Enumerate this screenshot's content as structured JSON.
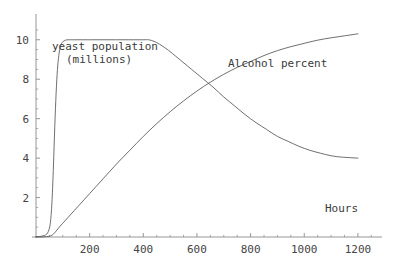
{
  "chart_data": {
    "type": "line",
    "title": "",
    "xlabel": "Hours",
    "ylabel": "",
    "xlim": [
      0,
      1260
    ],
    "ylim": [
      0,
      10.8
    ],
    "grid": false,
    "legend_position": "inline-annotations",
    "x_ticks": [
      200,
      400,
      600,
      800,
      1000,
      1200
    ],
    "y_ticks": [
      2,
      4,
      6,
      8,
      10
    ],
    "x_tick_labels": [
      "200",
      "400",
      "600",
      "800",
      "1000",
      "1200"
    ],
    "y_tick_labels": [
      "2",
      "4",
      "6",
      "8",
      "10"
    ],
    "annotations": [
      {
        "name": "yeast-population-label",
        "line1": "yeast population",
        "line2": "(millions)"
      },
      {
        "name": "alcohol-percent-label",
        "text": "Alcohol percent"
      },
      {
        "name": "hours-axis-label",
        "text": "Hours"
      }
    ],
    "series": [
      {
        "name": "yeast population (millions)",
        "color": "#555555",
        "x": [
          0,
          20,
          40,
          50,
          55,
          60,
          65,
          70,
          75,
          80,
          85,
          90,
          95,
          100,
          110,
          120,
          130,
          150,
          200,
          250,
          300,
          350,
          400,
          420,
          440,
          460,
          480,
          500,
          540,
          580,
          620,
          660,
          700,
          740,
          780,
          820,
          860,
          900,
          940,
          980,
          1020,
          1060,
          1100,
          1140,
          1200
        ],
        "y": [
          0.02,
          0.04,
          0.15,
          0.45,
          0.9,
          1.9,
          3.6,
          5.6,
          7.3,
          8.5,
          9.2,
          9.6,
          9.8,
          9.9,
          9.98,
          10.0,
          10.0,
          10.0,
          10.0,
          10.0,
          10.0,
          10.0,
          10.0,
          10.0,
          9.92,
          9.78,
          9.6,
          9.4,
          8.95,
          8.5,
          8.05,
          7.6,
          7.1,
          6.65,
          6.2,
          5.8,
          5.45,
          5.1,
          4.85,
          4.6,
          4.4,
          4.25,
          4.12,
          4.05,
          4.0
        ]
      },
      {
        "name": "Alcohol percent",
        "color": "#555555",
        "x": [
          0,
          20,
          40,
          55,
          65,
          75,
          90,
          110,
          130,
          160,
          200,
          250,
          300,
          350,
          400,
          450,
          500,
          550,
          600,
          650,
          700,
          750,
          800,
          850,
          900,
          950,
          1000,
          1050,
          1100,
          1150,
          1200
        ],
        "y": [
          0.0,
          0.0,
          0.02,
          0.06,
          0.15,
          0.3,
          0.55,
          0.85,
          1.15,
          1.6,
          2.2,
          2.95,
          3.7,
          4.4,
          5.1,
          5.75,
          6.35,
          6.9,
          7.4,
          7.85,
          8.25,
          8.6,
          8.9,
          9.2,
          9.45,
          9.65,
          9.82,
          9.98,
          10.1,
          10.2,
          10.3
        ]
      }
    ]
  },
  "axes": {
    "axis_color": "#8a8a8a",
    "tick_color": "#8a8a8a",
    "label_color": "#444444"
  }
}
